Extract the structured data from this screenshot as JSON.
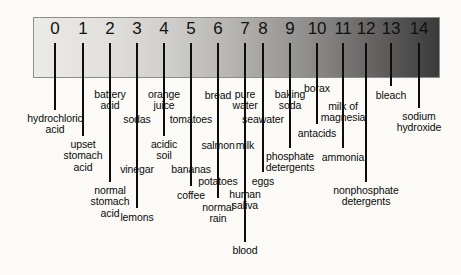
{
  "diagram": {
    "type": "ph-scale",
    "bar": {
      "gradient_start_color": "#eceae7",
      "gradient_end_color": "#3a3a3a",
      "border_color": "#8d8d8d"
    },
    "background_color": "#fbfaf7",
    "text_color": "#0b0b0b",
    "line_color": "#0d0d0d"
  },
  "ticks": [
    {
      "label": "0",
      "x": 55
    },
    {
      "label": "1",
      "x": 83
    },
    {
      "label": "2",
      "x": 110
    },
    {
      "label": "3",
      "x": 137
    },
    {
      "label": "4",
      "x": 164
    },
    {
      "label": "5",
      "x": 191
    },
    {
      "label": "6",
      "x": 218
    },
    {
      "label": "7",
      "x": 245
    },
    {
      "label": "8",
      "x": 263
    },
    {
      "label": "9",
      "x": 290
    },
    {
      "label": "10",
      "x": 317
    },
    {
      "label": "11",
      "x": 343
    },
    {
      "label": "12",
      "x": 366
    },
    {
      "label": "13",
      "x": 391
    },
    {
      "label": "14",
      "x": 419
    }
  ],
  "substances": [
    {
      "name": "hydrochloric\nacid",
      "x": 55,
      "line_bottom": 110,
      "label_y": 113,
      "align": "center"
    },
    {
      "name": "upset\nstomach\nacid",
      "x": 83,
      "line_bottom": 136,
      "label_y": 139,
      "align": "center"
    },
    {
      "name": "battery\nacid",
      "x": 110,
      "line_bottom": 86,
      "label_y": 89,
      "align": "center"
    },
    {
      "name": "normal\nstomach\nacid",
      "x": 110,
      "line_bottom": 182,
      "label_y": 185,
      "align": "center"
    },
    {
      "name": "sodas",
      "x": 137,
      "line_bottom": 110,
      "label_y": 114,
      "align": "center"
    },
    {
      "name": "vinegar",
      "x": 137,
      "line_bottom": 160,
      "label_y": 164,
      "align": "center"
    },
    {
      "name": "lemons",
      "x": 137,
      "line_bottom": 208,
      "label_y": 212,
      "align": "center"
    },
    {
      "name": "orange\njuice",
      "x": 164,
      "line_bottom": 86,
      "label_y": 89,
      "align": "center"
    },
    {
      "name": "acidic\nsoil",
      "x": 164,
      "line_bottom": 136,
      "label_y": 139,
      "align": "center"
    },
    {
      "name": "tomatoes",
      "x": 191,
      "line_bottom": 110,
      "label_y": 114,
      "align": "center"
    },
    {
      "name": "bananas",
      "x": 191,
      "line_bottom": 160,
      "label_y": 164,
      "align": "center"
    },
    {
      "name": "coffee",
      "x": 191,
      "line_bottom": 186,
      "label_y": 190,
      "align": "center"
    },
    {
      "name": "bread",
      "x": 218,
      "line_bottom": 86,
      "label_y": 90,
      "align": "center"
    },
    {
      "name": "salmon",
      "x": 218,
      "line_bottom": 136,
      "label_y": 140,
      "align": "center"
    },
    {
      "name": "potatoes",
      "x": 218,
      "line_bottom": 172,
      "label_y": 176,
      "align": "center"
    },
    {
      "name": "normal\nrain",
      "x": 218,
      "line_bottom": 198,
      "label_y": 202,
      "align": "center"
    },
    {
      "name": "pure\nwater",
      "x": 245,
      "line_bottom": 86,
      "label_y": 89,
      "align": "center"
    },
    {
      "name": "milk",
      "x": 245,
      "line_bottom": 136,
      "label_y": 140,
      "align": "center"
    },
    {
      "name": "human\nsaliva",
      "x": 245,
      "line_bottom": 186,
      "label_y": 189,
      "align": "center"
    },
    {
      "name": "blood",
      "x": 245,
      "line_bottom": 242,
      "label_y": 245,
      "align": "center"
    },
    {
      "name": "seawater",
      "x": 263,
      "line_bottom": 110,
      "label_y": 114,
      "align": "center"
    },
    {
      "name": "eggs",
      "x": 263,
      "line_bottom": 172,
      "label_y": 176,
      "align": "center"
    },
    {
      "name": "baking\nsoda",
      "x": 290,
      "line_bottom": 86,
      "label_y": 89,
      "align": "center"
    },
    {
      "name": "phosphate\ndetergents",
      "x": 290,
      "line_bottom": 148,
      "label_y": 151,
      "align": "center"
    },
    {
      "name": "borax",
      "x": 317,
      "line_bottom": 80,
      "label_y": 83,
      "align": "center"
    },
    {
      "name": "antacids",
      "x": 317,
      "line_bottom": 124,
      "label_y": 128,
      "align": "center"
    },
    {
      "name": "milk of\nmagnesia",
      "x": 343,
      "line_bottom": 98,
      "label_y": 101,
      "align": "center"
    },
    {
      "name": "ammonia",
      "x": 343,
      "line_bottom": 148,
      "label_y": 152,
      "align": "center"
    },
    {
      "name": "nonphosphate\ndetergents",
      "x": 366,
      "line_bottom": 182,
      "label_y": 185,
      "align": "center"
    },
    {
      "name": "bleach",
      "x": 391,
      "line_bottom": 86,
      "label_y": 90,
      "align": "center"
    },
    {
      "name": "sodium\nhydroxide",
      "x": 419,
      "line_bottom": 108,
      "label_y": 111,
      "align": "center"
    }
  ]
}
